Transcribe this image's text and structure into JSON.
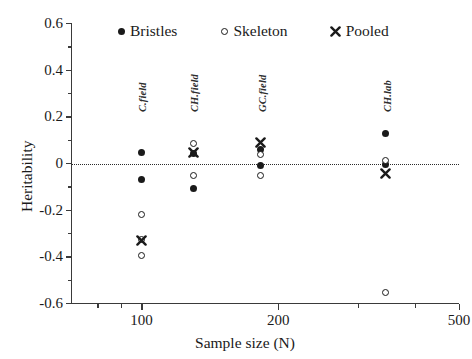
{
  "chart_data": {
    "type": "scatter",
    "title": "",
    "xlabel": "Sample size (N)",
    "ylabel": "Heritability",
    "xscale": "log",
    "xlim": [
      70,
      500
    ],
    "ylim": [
      -0.6,
      0.6
    ],
    "xticks": [
      100,
      200,
      500
    ],
    "xtick_labels": [
      "100",
      "200",
      "500"
    ],
    "yticks": [
      -0.6,
      -0.4,
      -0.2,
      0,
      0.2,
      0.4,
      0.6
    ],
    "ytick_labels": [
      "-0.6",
      "-0.4",
      "-0.2",
      "0",
      "0.2",
      "0.4",
      "0.6"
    ],
    "grid": false,
    "zero_reference_line": 0,
    "legend_position": "top",
    "legend": [
      {
        "name": "Bristles",
        "marker": "filled-circle"
      },
      {
        "name": "Skeleton",
        "marker": "open-circle"
      },
      {
        "name": "Pooled",
        "marker": "cross-x"
      }
    ],
    "group_annotations": [
      {
        "label": "C.field",
        "x": 100
      },
      {
        "label": "CH.field",
        "x": 130
      },
      {
        "label": "GC.field",
        "x": 183
      },
      {
        "label": "CH.lab",
        "x": 345
      }
    ],
    "series": [
      {
        "name": "Bristles",
        "marker": "filled-circle",
        "points": [
          {
            "x": 100,
            "y": 0.045,
            "group": "C.field"
          },
          {
            "x": 100,
            "y": -0.072,
            "group": "C.field"
          },
          {
            "x": 130,
            "y": 0.042,
            "group": "CH.field"
          },
          {
            "x": 130,
            "y": -0.11,
            "group": "CH.field"
          },
          {
            "x": 183,
            "y": 0.06,
            "group": "GC.field"
          },
          {
            "x": 183,
            "y": -0.012,
            "group": "GC.field"
          },
          {
            "x": 345,
            "y": 0.128,
            "group": "CH.lab"
          },
          {
            "x": 345,
            "y": -0.005,
            "group": "CH.lab"
          }
        ]
      },
      {
        "name": "Skeleton",
        "marker": "open-circle",
        "points": [
          {
            "x": 100,
            "y": -0.222,
            "group": "C.field"
          },
          {
            "x": 100,
            "y": -0.328,
            "group": "C.field"
          },
          {
            "x": 100,
            "y": -0.398,
            "group": "C.field"
          },
          {
            "x": 130,
            "y": 0.082,
            "group": "CH.field"
          },
          {
            "x": 130,
            "y": -0.052,
            "group": "CH.field"
          },
          {
            "x": 183,
            "y": 0.036,
            "group": "GC.field"
          },
          {
            "x": 183,
            "y": -0.055,
            "group": "GC.field"
          },
          {
            "x": 345,
            "y": 0.01,
            "group": "CH.lab"
          },
          {
            "x": 345,
            "y": -0.555,
            "group": "CH.lab"
          }
        ]
      },
      {
        "name": "Pooled",
        "marker": "cross-x",
        "points": [
          {
            "x": 100,
            "y": -0.33,
            "group": "C.field"
          },
          {
            "x": 130,
            "y": 0.044,
            "group": "CH.field"
          },
          {
            "x": 183,
            "y": 0.086,
            "group": "GC.field"
          },
          {
            "x": 345,
            "y": -0.045,
            "group": "CH.lab"
          }
        ]
      }
    ]
  },
  "colors": {
    "marker": "#1a1a1a",
    "axis": "#3a3a3a",
    "background": "#ffffff"
  }
}
